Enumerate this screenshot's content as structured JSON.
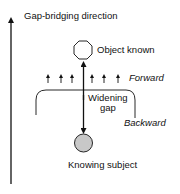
{
  "diagram": {
    "axis_label": "Gap-bridging direction",
    "top_node": {
      "label": "Object known",
      "shape": "octagon",
      "fill": "#ffffff"
    },
    "bottom_node": {
      "label": "Knowing subject",
      "shape": "circle",
      "fill": "#c8c8c8"
    },
    "gap_label_line1": "Widening",
    "gap_label_line2": "gap",
    "forward_label": "Forward",
    "backward_label": "Backward",
    "small_arrow_count": 6
  },
  "colors": {
    "stroke": "#111111",
    "subject_fill": "#c8c8c8",
    "background": "#ffffff"
  }
}
